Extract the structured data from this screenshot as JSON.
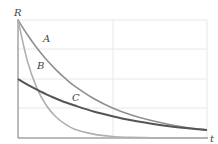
{
  "chart_data": {
    "type": "line",
    "title": "",
    "xlabel": "t",
    "ylabel": "R",
    "grid": true,
    "xlim": [
      0,
      2
    ],
    "ylim": [
      0,
      4
    ],
    "x": [
      0,
      0.1,
      0.2,
      0.3,
      0.4,
      0.5,
      0.6,
      0.8,
      1.0,
      1.2,
      1.4,
      1.6,
      1.8,
      2.0
    ],
    "series": [
      {
        "name": "A",
        "color": "#8f8f8f",
        "values": [
          4.0,
          3.5,
          3.05,
          2.66,
          2.32,
          2.02,
          1.76,
          1.34,
          1.02,
          0.78,
          0.6,
          0.46,
          0.35,
          0.27
        ]
      },
      {
        "name": "B",
        "color": "#b0b0b0",
        "values": [
          4.0,
          2.6,
          1.69,
          1.1,
          0.72,
          0.47,
          0.3,
          0.13,
          0.05,
          0.02,
          0.01,
          0.0,
          0.0,
          0.0
        ]
      },
      {
        "name": "C",
        "color": "#555555",
        "values": [
          2.0,
          1.81,
          1.64,
          1.48,
          1.34,
          1.21,
          1.1,
          0.9,
          0.74,
          0.6,
          0.49,
          0.4,
          0.33,
          0.27
        ]
      }
    ],
    "annotations": [
      {
        "text": "A",
        "series": "A"
      },
      {
        "text": "B",
        "series": "B"
      },
      {
        "text": "C",
        "series": "C"
      }
    ]
  },
  "labels": {
    "y_axis": "R",
    "x_axis": "t",
    "curve_a": "A",
    "curve_b": "B",
    "curve_c": "C"
  }
}
